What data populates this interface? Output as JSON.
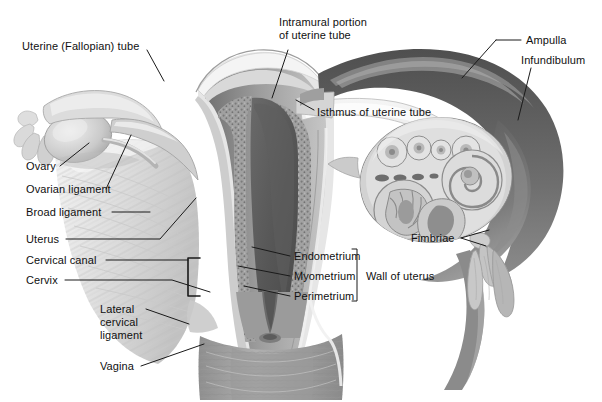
{
  "figure": {
    "width": 602,
    "height": 402,
    "background": "#ffffff"
  },
  "palette": {
    "outline": "#2b2b2b",
    "leader_line": "#1a1a1a",
    "text": "#101010",
    "cavity_dark": "#555555",
    "myometrium_mid": "#9a9a9a",
    "endometrium_speckle": "#8d8d8d",
    "perimetrium_light": "#e9e9e9",
    "serosa_highlight": "#f2f2f2",
    "broad_ligament": "#dcdcdc",
    "ovary_body": "#cfcfcf",
    "tube_wall_dark": "#6e6e6e",
    "tube_lumen": "#d9d9d9",
    "vagina_wall": "#a8a8a8",
    "follicle_fill": "#d6d6d6",
    "shadow": "#7b7b7b"
  },
  "labels": [
    {
      "id": "uterine-fallopian-tube",
      "text": "Uterine (Fallopian) tube",
      "x": 22,
      "y": 46,
      "align": "left",
      "leader": [
        [
          147,
          50
        ],
        [
          164,
          81
        ]
      ]
    },
    {
      "id": "intramural-portion-of-uterine-tube",
      "text": "Intramural portion\nof uterine tube",
      "x": 279,
      "y": 22,
      "align": "left",
      "leader": [
        [
          288,
          50
        ],
        [
          272,
          98
        ]
      ]
    },
    {
      "id": "isthmus-of-uterine-tube",
      "text": "Isthmus of uterine tube",
      "x": 317,
      "y": 107,
      "align": "left",
      "leader": [
        [
          314,
          110
        ],
        [
          296,
          100
        ]
      ]
    },
    {
      "id": "ampulla",
      "text": "Ampulla",
      "x": 526,
      "y": 36,
      "align": "left",
      "leader": [
        [
          521,
          40
        ],
        [
          462,
          78
        ]
      ]
    },
    {
      "id": "infundibulum",
      "text": "Infundibulum",
      "x": 521,
      "y": 56,
      "align": "left",
      "leader": [
        [
          531,
          68
        ],
        [
          518,
          120
        ]
      ]
    },
    {
      "id": "ovary",
      "text": "Ovary",
      "x": 26,
      "y": 167,
      "align": "left",
      "leader": [
        [
          60,
          166
        ],
        [
          89,
          143
        ]
      ]
    },
    {
      "id": "ovarian-ligament",
      "text": "Ovarian ligament",
      "x": 26,
      "y": 191,
      "align": "left",
      "leader": [
        [
          106,
          189
        ],
        [
          131,
          135
        ]
      ]
    },
    {
      "id": "broad-ligament",
      "text": "Broad ligament",
      "x": 26,
      "y": 211,
      "align": "left",
      "leader": [
        [
          112,
          216
        ],
        [
          148,
          216
        ]
      ]
    },
    {
      "id": "uterus",
      "text": "Uterus",
      "x": 26,
      "y": 237,
      "align": "left",
      "leader": [
        [
          66,
          242
        ],
        [
          160,
          242
        ],
        [
          190,
          196
        ]
      ]
    },
    {
      "id": "cervical-canal",
      "text": "Cervical canal",
      "x": 26,
      "y": 258,
      "align": "left",
      "leader": [
        [
          106,
          263
        ],
        [
          204,
          263
        ]
      ]
    },
    {
      "id": "cervix",
      "text": "Cervix",
      "x": 26,
      "y": 278,
      "align": "left",
      "leader": [
        [
          65,
          283
        ],
        [
          170,
          283
        ],
        [
          209,
          292
        ]
      ]
    },
    {
      "id": "lateral-cervical-ligament",
      "text": "Lateral\ncervical\nligament",
      "x": 100,
      "y": 305,
      "align": "left",
      "leader": [
        [
          146,
          309
        ],
        [
          185,
          324
        ]
      ]
    },
    {
      "id": "vagina",
      "text": "Vagina",
      "x": 100,
      "y": 361,
      "align": "left",
      "leader": [
        [
          141,
          366
        ],
        [
          200,
          345
        ]
      ]
    },
    {
      "id": "endometrium",
      "text": "Endometrium",
      "x": 294,
      "y": 254,
      "align": "left",
      "leader": [
        [
          290,
          259
        ],
        [
          252,
          249
        ]
      ]
    },
    {
      "id": "myometrium",
      "text": "Myometrium",
      "x": 294,
      "y": 274,
      "align": "left",
      "leader": [
        [
          290,
          279
        ],
        [
          240,
          268
        ]
      ]
    },
    {
      "id": "perimetrium",
      "text": "Perimetrium",
      "x": 294,
      "y": 294,
      "align": "left",
      "leader": [
        [
          290,
          299
        ],
        [
          245,
          288
        ]
      ]
    },
    {
      "id": "wall-of-uterus",
      "text": "Wall of uterus",
      "x": 366,
      "y": 274,
      "align": "left",
      "leader": []
    },
    {
      "id": "fimbriae",
      "text": "Fimbriae",
      "x": 411,
      "y": 236,
      "align": "left",
      "leader": [
        [
          461,
          241
        ],
        [
          487,
          233
        ]
      ]
    }
  ],
  "brackets": {
    "wall_of_uterus": {
      "x": 357,
      "y_top": 249,
      "y_bottom": 301
    },
    "cervix_marker": {
      "x": 188,
      "y_top": 258,
      "width": 12,
      "height": 38
    }
  },
  "fimbriae_arrow": {
    "tip_x": 461,
    "tip_y": 241,
    "prongs": 2
  }
}
